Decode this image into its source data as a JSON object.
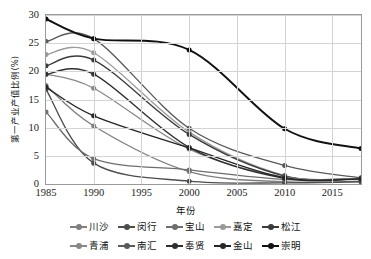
{
  "chart_data": {
    "type": "line",
    "title": "",
    "xlabel": "年份",
    "ylabel": "第一产业产值比例(%)",
    "xlim": [
      1985,
      2018
    ],
    "ylim": [
      0,
      30
    ],
    "yticks": [
      0,
      5,
      10,
      15,
      20,
      25,
      30
    ],
    "xticks": [
      1985,
      1990,
      1995,
      2000,
      2005,
      2010,
      2015
    ],
    "x": [
      1985,
      1990,
      2000,
      2010,
      2018
    ],
    "grid": true,
    "legend_position": "bottom",
    "series": [
      {
        "name": "川沙",
        "color": "#808080",
        "values": [
          17.5,
          10.3,
          2.2,
          0.4,
          0.5
        ]
      },
      {
        "name": "闵行",
        "color": "#4d4d4d",
        "values": [
          16.8,
          3.7,
          0.5,
          0.2,
          0.4
        ]
      },
      {
        "name": "宝山",
        "color": "#6e6e6e",
        "values": [
          12.8,
          4.5,
          2.5,
          0.8,
          1.0
        ]
      },
      {
        "name": "嘉定",
        "color": "#9a9a9a",
        "values": [
          23.0,
          23.3,
          9.2,
          1.5,
          1.0
        ]
      },
      {
        "name": "松江",
        "color": "#3a3a3a",
        "values": [
          21.0,
          22.0,
          8.8,
          1.4,
          1.0
        ]
      },
      {
        "name": "青浦",
        "color": "#888888",
        "values": [
          19.5,
          17.0,
          6.2,
          1.2,
          1.0
        ]
      },
      {
        "name": "南汇",
        "color": "#5a5a5a",
        "values": [
          25.3,
          25.8,
          9.9,
          3.3,
          1.1
        ]
      },
      {
        "name": "奉贤",
        "color": "#2e2e2e",
        "values": [
          19.5,
          19.5,
          6.5,
          1.0,
          0.9
        ]
      },
      {
        "name": "金山",
        "color": "#262626",
        "values": [
          17.2,
          12.1,
          6.4,
          1.1,
          0.9
        ]
      },
      {
        "name": "崇明",
        "color": "#111111",
        "values": [
          29.3,
          25.8,
          23.8,
          9.8,
          6.3
        ]
      }
    ]
  },
  "axis": {
    "y_tick_labels": [
      "0",
      "5",
      "10",
      "15",
      "20",
      "25",
      "30"
    ],
    "x_tick_labels": [
      "1985",
      "1990",
      "1995",
      "2000",
      "2005",
      "2010",
      "2015"
    ],
    "y_title": "第一产业产值比例(%)",
    "x_title": "年份"
  },
  "legend": {
    "row1": [
      "川沙",
      "闵行",
      "宝山",
      "嘉定",
      "松江"
    ],
    "row2": [
      "青浦",
      "南汇",
      "奉贤",
      "金山",
      "崇明"
    ]
  }
}
